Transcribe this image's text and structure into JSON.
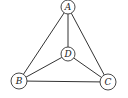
{
  "diagram": {
    "type": "graph",
    "title": "",
    "colors": {
      "stroke": "#333333",
      "fill": "#ffffff",
      "label": "#222222"
    },
    "nodes": [
      {
        "id": "A",
        "label": "A",
        "x": 68,
        "y": 7,
        "r": 7
      },
      {
        "id": "B",
        "label": "B",
        "x": 19,
        "y": 81,
        "r": 8
      },
      {
        "id": "C",
        "label": "C",
        "x": 108,
        "y": 82,
        "r": 8
      },
      {
        "id": "D",
        "label": "D",
        "x": 68,
        "y": 54,
        "r": 7
      }
    ],
    "edges": [
      {
        "from": "A",
        "to": "B"
      },
      {
        "from": "A",
        "to": "C"
      },
      {
        "from": "A",
        "to": "D"
      },
      {
        "from": "B",
        "to": "D"
      },
      {
        "from": "C",
        "to": "D"
      },
      {
        "from": "B",
        "to": "C"
      }
    ]
  }
}
